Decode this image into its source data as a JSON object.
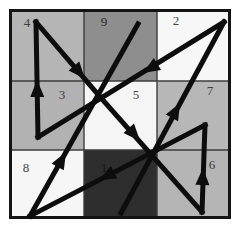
{
  "figure": {
    "name": "lo-shu-magic-square-path",
    "canvas": {
      "width": 243,
      "height": 239,
      "background": "#ffffff"
    },
    "frame": {
      "x": 9,
      "y": 9,
      "width": 222,
      "height": 210,
      "border_color": "#141414",
      "border_width": 3,
      "grid_line_color": "#3c3c3c",
      "grid_line_width": 1.4,
      "col_edges": [
        12,
        84,
        157,
        228
      ],
      "row_edges": [
        12,
        81,
        150,
        216
      ]
    },
    "magic_square_rows": [
      [
        "4",
        "9",
        "2"
      ],
      [
        "3",
        "5",
        "7"
      ],
      [
        "8",
        "1",
        "6"
      ]
    ],
    "cells": [
      {
        "value": "4",
        "x": 12,
        "y": 12,
        "w": 72,
        "h": 69,
        "fill": "#b5b5b5",
        "num_x": 27,
        "num_y": 22,
        "num_color": "#3d3d3d"
      },
      {
        "value": "9",
        "x": 84,
        "y": 12,
        "w": 73,
        "h": 69,
        "fill": "#8e8e8e",
        "num_x": 104,
        "num_y": 21,
        "num_color": "#2a2a2a"
      },
      {
        "value": "2",
        "x": 157,
        "y": 12,
        "w": 71,
        "h": 69,
        "fill": "#f7f7f7",
        "num_x": 176,
        "num_y": 20,
        "num_color": "#474747"
      },
      {
        "value": "3",
        "x": 12,
        "y": 81,
        "w": 72,
        "h": 69,
        "fill": "#b2b2b2",
        "num_x": 62,
        "num_y": 94,
        "num_color": "#3d3d3d"
      },
      {
        "value": "5",
        "x": 84,
        "y": 81,
        "w": 73,
        "h": 69,
        "fill": "#f5f5f5",
        "num_x": 136,
        "num_y": 94,
        "num_color": "#474747"
      },
      {
        "value": "7",
        "x": 157,
        "y": 81,
        "w": 71,
        "h": 69,
        "fill": "#b7b7b7",
        "num_x": 210,
        "num_y": 90,
        "num_color": "#3d3d3d"
      },
      {
        "value": "8",
        "x": 12,
        "y": 150,
        "w": 72,
        "h": 66,
        "fill": "#f6f6f6",
        "num_x": 26,
        "num_y": 167,
        "num_color": "#474747"
      },
      {
        "value": "1",
        "x": 84,
        "y": 150,
        "w": 73,
        "h": 66,
        "fill": "#2e2e2e",
        "num_x": 104,
        "num_y": 167,
        "num_color": "#151515"
      },
      {
        "value": "6",
        "x": 157,
        "y": 150,
        "w": 71,
        "h": 66,
        "fill": "#b5b5b5",
        "num_x": 212,
        "num_y": 164,
        "num_color": "#3a3a3a"
      }
    ],
    "number_font_size": 13,
    "path": {
      "color": "#0d0d0d",
      "stroke_width": 5,
      "head_length": 17,
      "head_half_width": 7,
      "sequence": [
        "1",
        "2",
        "3",
        "4",
        "5",
        "6",
        "7",
        "8",
        "9"
      ],
      "vertices": {
        "1": [
          121,
          213
        ],
        "2": [
          224,
          22
        ],
        "3": [
          38,
          137
        ],
        "4": [
          36,
          22
        ],
        "5": [
          101,
          98
        ],
        "6": [
          202,
          212
        ],
        "7": [
          205,
          125
        ],
        "8": [
          30,
          216
        ],
        "9": [
          138,
          24
        ]
      },
      "segments": [
        {
          "from": "1",
          "to": "2",
          "head_tip": [
            180,
            103
          ]
        },
        {
          "from": "2",
          "to": "3",
          "head_tip": [
            143,
            73
          ]
        },
        {
          "from": "3",
          "to": "4",
          "head_tip": [
            37,
            80
          ]
        },
        {
          "from": "4",
          "to": "5",
          "head_tip": [
            85,
            79
          ]
        },
        {
          "from": "5",
          "to": "6",
          "head_tip": [
            140,
            141
          ]
        },
        {
          "from": "6",
          "to": "7",
          "head_tip": [
            203,
            168
          ]
        },
        {
          "from": "7",
          "to": "8",
          "head_tip": [
            99,
            180
          ]
        },
        {
          "from": "8",
          "to": "9",
          "head_tip": [
            66,
            152
          ]
        }
      ]
    }
  }
}
